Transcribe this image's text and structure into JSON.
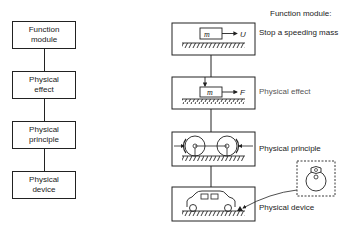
{
  "left_column": {
    "boxes": [
      {
        "line1": "Function",
        "line2": "module"
      },
      {
        "line1": "Physical",
        "line2": "effect"
      },
      {
        "line1": "Physical",
        "line2": "principle"
      },
      {
        "line1": "Physical",
        "line2": "device"
      }
    ]
  },
  "right_column": {
    "header": "Function module:",
    "labels": [
      "Stop a speeding mass",
      "Physical effect",
      "Physical principle",
      "Physical device"
    ],
    "symbols": {
      "mass": "m",
      "velocity": "U",
      "force": "F"
    }
  }
}
